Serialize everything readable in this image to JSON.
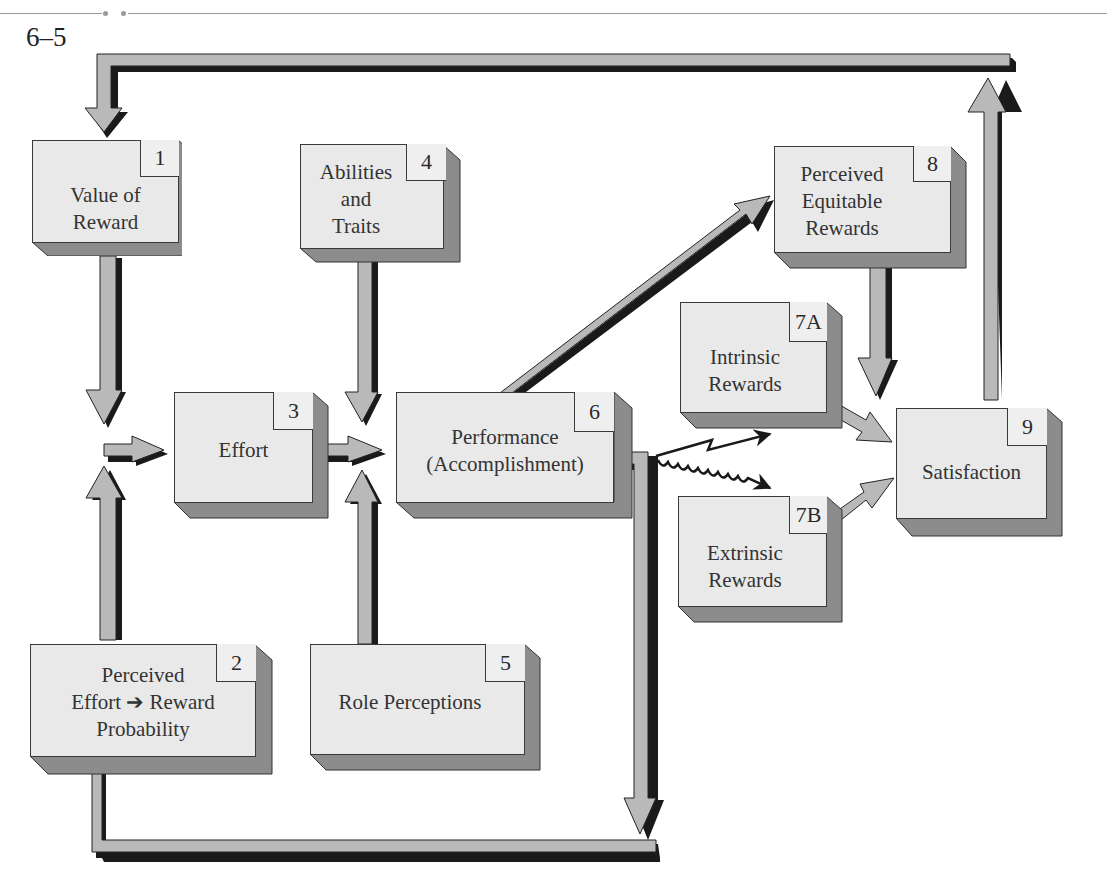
{
  "figure": {
    "number": "6–5"
  },
  "boxes": [
    {
      "id": "1",
      "number": "1",
      "label": "Value of\nReward"
    },
    {
      "id": "2",
      "number": "2",
      "label": "Perceived\nEffort ➔ Reward\nProbability"
    },
    {
      "id": "3",
      "number": "3",
      "label": "Effort"
    },
    {
      "id": "4",
      "number": "4",
      "label": "Abilities\nand\nTraits"
    },
    {
      "id": "5",
      "number": "5",
      "label": "Role Perceptions"
    },
    {
      "id": "6",
      "number": "6",
      "label": "Performance\n(Accomplishment)"
    },
    {
      "id": "7A",
      "number": "7A",
      "label": "Intrinsic\nRewards"
    },
    {
      "id": "7B",
      "number": "7B",
      "label": "Extrinsic\nRewards"
    },
    {
      "id": "8",
      "number": "8",
      "label": "Perceived\nEquitable\nRewards"
    },
    {
      "id": "9",
      "number": "9",
      "label": "Satisfaction"
    }
  ],
  "connections": [
    {
      "from": "1",
      "to": "3",
      "style": "block-arrow"
    },
    {
      "from": "2",
      "to": "3",
      "style": "block-arrow"
    },
    {
      "from": "3",
      "to": "6",
      "style": "block-arrow"
    },
    {
      "from": "4",
      "to": "6",
      "style": "block-arrow"
    },
    {
      "from": "5",
      "to": "6",
      "style": "block-arrow"
    },
    {
      "from": "6",
      "to": "8",
      "style": "block-arrow"
    },
    {
      "from": "6",
      "to": "7A",
      "style": "zigzag-arrow"
    },
    {
      "from": "6",
      "to": "7B",
      "style": "wavy-arrow"
    },
    {
      "from": "6",
      "to": "2",
      "style": "feedback-loop"
    },
    {
      "from": "7A",
      "to": "9",
      "style": "block-arrow"
    },
    {
      "from": "7B",
      "to": "9",
      "style": "block-arrow"
    },
    {
      "from": "8",
      "to": "9",
      "style": "block-arrow"
    },
    {
      "from": "9",
      "to": "1",
      "style": "feedback-loop"
    }
  ],
  "colors": {
    "box_face": "#e9e9e9",
    "box_side": "#8c8c8c",
    "arrow_fill": "#b9b9b9",
    "arrow_shadow": "#1a1a1a",
    "outline": "#3a3a3a"
  }
}
